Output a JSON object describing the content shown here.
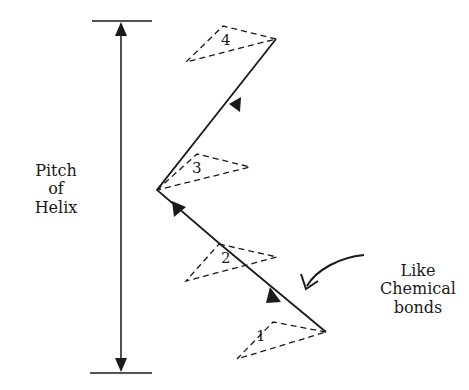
{
  "diagram": {
    "type": "helix-pitch-diagram",
    "pitch_label": {
      "line1": "Pitch",
      "line2": "of",
      "line3": "Helix"
    },
    "annotation": {
      "line1": "Like",
      "line2": "Chemical",
      "line3": "bonds"
    },
    "units": [
      {
        "id": "1",
        "label": "1"
      },
      {
        "id": "2",
        "label": "2"
      },
      {
        "id": "3",
        "label": "3"
      },
      {
        "id": "4",
        "label": "4"
      }
    ],
    "colors": {
      "stroke": "#1a1a1a",
      "background": "#ffffff"
    }
  }
}
